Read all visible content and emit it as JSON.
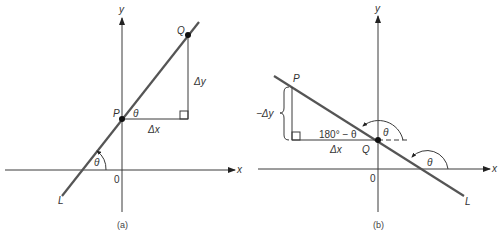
{
  "panel_a": {
    "caption": "(a)",
    "x_axis_label": "x",
    "y_axis_label": "y",
    "origin_label": "0",
    "point_p_label": "P",
    "point_q_label": "Q",
    "line_label": "L",
    "delta_x_label": "Δx",
    "delta_y_label": "Δy",
    "angle_at_p_label": "θ",
    "angle_at_x_axis_label": "θ"
  },
  "panel_b": {
    "caption": "(b)",
    "x_axis_label": "x",
    "y_axis_label": "y",
    "origin_label": "0",
    "point_p_label": "P",
    "point_q_label": "Q",
    "line_label": "L",
    "delta_x_label": "Δx",
    "neg_delta_y_label": "−Δy",
    "supplement_angle_label": "180° − θ",
    "angle_at_q_label": "θ",
    "angle_at_x_axis_label": "θ"
  }
}
